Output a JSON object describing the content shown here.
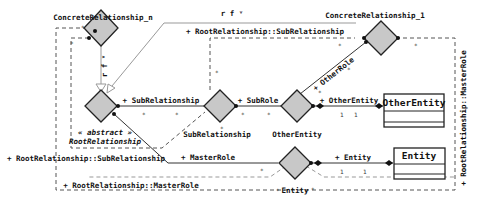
{
  "diagram": {
    "type": "UML association/relationship diagram",
    "relationships": [
      {
        "id": "concrete_n",
        "label": "ConcreteRelationship_n"
      },
      {
        "id": "concrete_1",
        "label": "ConcreteRelationship_1"
      },
      {
        "id": "root",
        "label": "RootRelationship",
        "stereotype": "« abstract »"
      },
      {
        "id": "sub",
        "label": "SubRelationship"
      },
      {
        "id": "other",
        "label": "OtherEntity"
      },
      {
        "id": "entity",
        "label": "Entity"
      }
    ],
    "classes": [
      {
        "id": "other_entity",
        "name": "OtherEntity"
      },
      {
        "id": "entity_cls",
        "name": "Entity"
      }
    ],
    "labels": {
      "rf_top": "r f ᵛ",
      "rf_vertical": "r f ᵛ",
      "root_sub_top": "+ RootRelationship::SubRelationship",
      "root_sub_left": "+ RootRelationship::SubRelationship",
      "root_master_bottom": "+ RootRelationship::MasterRole",
      "root_master_right": "+ RootRelationship::MasterRole",
      "sub_relationship_role": "+ SubRelationship",
      "sub_role": "+ SubRole",
      "other_role": "+ OtherRole",
      "other_entity_role": "+ OtherEntity",
      "master_role": "+ MasterRole",
      "entity_role": "+ Entity"
    },
    "multiplicities": {
      "star": "*",
      "one": "1"
    }
  }
}
